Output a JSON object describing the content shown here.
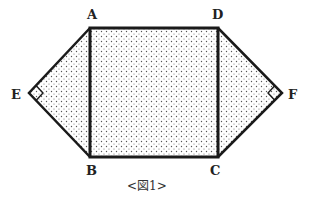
{
  "figure": {
    "caption": "<図1>",
    "vertices": {
      "A": {
        "label": "A",
        "x": 90,
        "y": 28
      },
      "D": {
        "label": "D",
        "x": 218,
        "y": 28
      },
      "B": {
        "label": "B",
        "x": 90,
        "y": 157
      },
      "C": {
        "label": "C",
        "x": 218,
        "y": 157
      },
      "E": {
        "label": "E",
        "x": 29,
        "y": 93
      },
      "F": {
        "label": "F",
        "x": 282,
        "y": 93
      }
    },
    "shapes": [
      {
        "name": "square-ABCD",
        "points": "A-D-C-B",
        "fill": "dotted"
      },
      {
        "name": "triangle-ABE",
        "points": "A-E-B",
        "right_angle_at": "E",
        "fill": "dotted"
      },
      {
        "name": "triangle-DFC",
        "points": "D-F-C",
        "right_angle_at": "F",
        "fill": "dotted"
      }
    ],
    "colors": {
      "stroke": "#1a1a1a",
      "dot": "#555555",
      "background": "#ffffff"
    }
  }
}
